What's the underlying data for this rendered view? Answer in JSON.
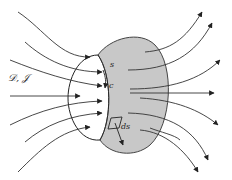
{
  "diagram": {
    "labels": {
      "field": "𝒟, 𝒥",
      "surface": "s",
      "contour": "c",
      "area_element": "ds"
    },
    "colors": {
      "surface_fill": "#c8c8c8",
      "line": "#222222",
      "background": "#ffffff"
    },
    "counts": {
      "incoming_field_lines": 7,
      "outgoing_field_lines": 8
    }
  }
}
